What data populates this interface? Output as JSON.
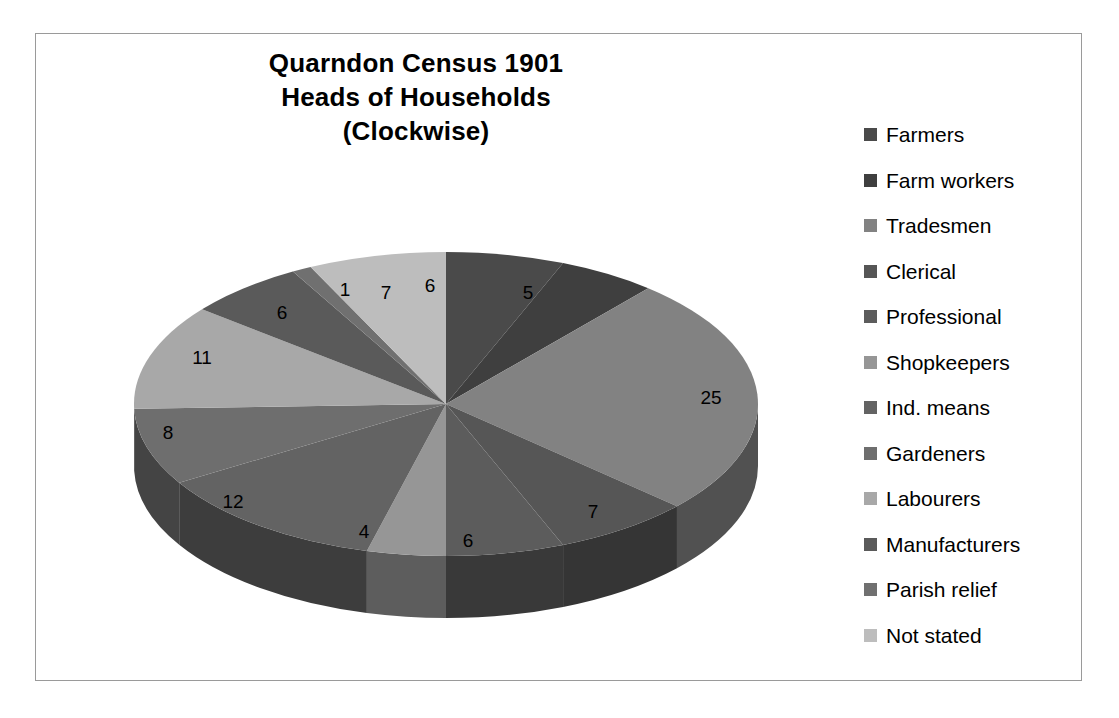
{
  "chart_data": {
    "type": "pie",
    "title": "Quarndon Census 1901 Heads of Households (Clockwise)",
    "title_lines": [
      "Quarndon Census 1901",
      "Heads of Households",
      "(Clockwise)"
    ],
    "xlabel": "",
    "ylabel": "",
    "legend_position": "right",
    "grid": false,
    "three_d": true,
    "direction": "clockwise",
    "total": 98,
    "categories": [
      "Farmers",
      "Farm workers",
      "Tradesmen",
      "Clerical",
      "Professional",
      "Shopkeepers",
      "Ind. means",
      "Gardeners",
      "Labourers",
      "Manufacturers",
      "Parish relief",
      "Not stated"
    ],
    "values": [
      6,
      5,
      25,
      7,
      6,
      4,
      12,
      8,
      11,
      6,
      1,
      7
    ],
    "colors": [
      "#4a4a4a",
      "#3f3f3f",
      "#828282",
      "#565656",
      "#5c5c5c",
      "#969696",
      "#636363",
      "#6e6e6e",
      "#a8a8a8",
      "#5a5a5a",
      "#707070",
      "#bdbdbd"
    ],
    "slices": [
      {
        "label": "Farmers",
        "value": 6,
        "color": "#4a4a4a",
        "label_x": 334,
        "label_y": 67
      },
      {
        "label": "Farm workers",
        "value": 5,
        "color": "#3f3f3f",
        "label_x": 432,
        "label_y": 74
      },
      {
        "label": "Tradesmen",
        "value": 25,
        "color": "#828282",
        "label_x": 615,
        "label_y": 179
      },
      {
        "label": "Clerical",
        "value": 7,
        "color": "#565656",
        "label_x": 497,
        "label_y": 293
      },
      {
        "label": "Professional",
        "value": 6,
        "color": "#5c5c5c",
        "label_x": 372,
        "label_y": 322
      },
      {
        "label": "Shopkeepers",
        "value": 4,
        "color": "#969696",
        "label_x": 268,
        "label_y": 313
      },
      {
        "label": "Ind. means",
        "value": 12,
        "color": "#636363",
        "label_x": 137,
        "label_y": 283
      },
      {
        "label": "Gardeners",
        "value": 8,
        "color": "#6e6e6e",
        "label_x": 72,
        "label_y": 214
      },
      {
        "label": "Labourers",
        "value": 11,
        "color": "#a8a8a8",
        "label_x": 106,
        "label_y": 139
      },
      {
        "label": "Manufacturers",
        "value": 6,
        "color": "#5a5a5a",
        "label_x": 186,
        "label_y": 94
      },
      {
        "label": "Parish relief",
        "value": 1,
        "color": "#707070",
        "label_x": 249,
        "label_y": 71
      },
      {
        "label": "Not stated",
        "value": 7,
        "color": "#bdbdbd",
        "label_x": 290,
        "label_y": 74
      }
    ]
  },
  "frame": {
    "border_color": "#9a9a9a",
    "background": "#ffffff"
  }
}
